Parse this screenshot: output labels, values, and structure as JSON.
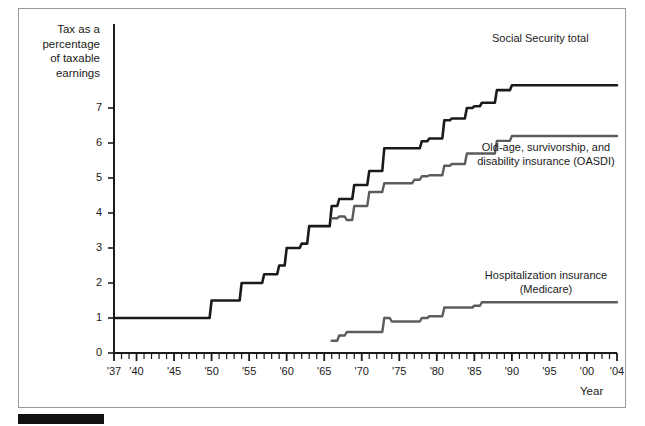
{
  "chart_data": {
    "type": "line",
    "title": "",
    "ylabel": "Tax as a percentage of taxable earnings",
    "xlabel": "Year",
    "xlim": [
      1937,
      2004
    ],
    "ylim": [
      0,
      7.9
    ],
    "yticks": [
      0,
      1,
      2,
      3,
      4,
      5,
      6,
      7
    ],
    "ytick_labels": [
      "0",
      "1",
      "2",
      "3",
      "4",
      "5",
      "6",
      "7"
    ],
    "xticks": [
      1937,
      1940,
      1945,
      1950,
      1955,
      1960,
      1965,
      1970,
      1975,
      1980,
      1985,
      1990,
      1995,
      2000,
      2004
    ],
    "xtick_labels": [
      "'37",
      "'40",
      "'45",
      "'50",
      "'55",
      "'60",
      "'65",
      "'70",
      "'75",
      "'80",
      "'85",
      "'90",
      "'95",
      "'00",
      "'04"
    ],
    "minor_tick_interval": 1,
    "grid": false,
    "legend_position": "inline-annotations",
    "series": [
      {
        "name": "Social Security total",
        "color": "#1a1a1a",
        "width": 2.6,
        "step": true,
        "points": [
          [
            1937,
            1.0
          ],
          [
            1949,
            1.0
          ],
          [
            1950,
            1.5
          ],
          [
            1953,
            1.5
          ],
          [
            1954,
            2.0
          ],
          [
            1956,
            2.0
          ],
          [
            1957,
            2.25
          ],
          [
            1958,
            2.25
          ],
          [
            1959,
            2.5
          ],
          [
            1960,
            3.0
          ],
          [
            1961,
            3.0
          ],
          [
            1962,
            3.125
          ],
          [
            1963,
            3.625
          ],
          [
            1965,
            3.625
          ],
          [
            1966,
            4.2
          ],
          [
            1967,
            4.4
          ],
          [
            1968,
            4.4
          ],
          [
            1969,
            4.8
          ],
          [
            1971,
            5.2
          ],
          [
            1972,
            5.2
          ],
          [
            1973,
            5.85
          ],
          [
            1977,
            5.85
          ],
          [
            1978,
            6.05
          ],
          [
            1979,
            6.13
          ],
          [
            1980,
            6.13
          ],
          [
            1981,
            6.65
          ],
          [
            1982,
            6.7
          ],
          [
            1983,
            6.7
          ],
          [
            1984,
            7.0
          ],
          [
            1985,
            7.05
          ],
          [
            1986,
            7.15
          ],
          [
            1987,
            7.15
          ],
          [
            1988,
            7.51
          ],
          [
            1990,
            7.65
          ],
          [
            2004,
            7.65
          ]
        ]
      },
      {
        "name": "Old-age, survivorship, and disability insurance (OASDI)",
        "color": "#5c5c5c",
        "width": 2.4,
        "step": true,
        "points": [
          [
            1966,
            3.85
          ],
          [
            1967,
            3.9
          ],
          [
            1968,
            3.8
          ],
          [
            1969,
            4.2
          ],
          [
            1971,
            4.6
          ],
          [
            1972,
            4.6
          ],
          [
            1973,
            4.85
          ],
          [
            1977,
            4.95
          ],
          [
            1978,
            5.05
          ],
          [
            1979,
            5.08
          ],
          [
            1980,
            5.08
          ],
          [
            1981,
            5.35
          ],
          [
            1982,
            5.4
          ],
          [
            1983,
            5.4
          ],
          [
            1984,
            5.7
          ],
          [
            1985,
            5.7
          ],
          [
            1986,
            5.7
          ],
          [
            1987,
            5.7
          ],
          [
            1988,
            6.06
          ],
          [
            1990,
            6.2
          ],
          [
            2004,
            6.2
          ]
        ]
      },
      {
        "name": "Hospitalization insurance (Medicare)",
        "color": "#5c5c5c",
        "width": 2.4,
        "step": true,
        "points": [
          [
            1966,
            0.35
          ],
          [
            1967,
            0.5
          ],
          [
            1968,
            0.6
          ],
          [
            1972,
            0.6
          ],
          [
            1973,
            1.0
          ],
          [
            1974,
            0.9
          ],
          [
            1977,
            0.9
          ],
          [
            1978,
            1.0
          ],
          [
            1979,
            1.05
          ],
          [
            1980,
            1.05
          ],
          [
            1981,
            1.3
          ],
          [
            1982,
            1.3
          ],
          [
            1985,
            1.35
          ],
          [
            1986,
            1.45
          ],
          [
            1988,
            1.45
          ],
          [
            1990,
            1.45
          ],
          [
            2004,
            1.45
          ]
        ]
      }
    ]
  },
  "annotations": {
    "ss_total": "Social Security total",
    "oasdi_line1": "Old-age, survivorship, and",
    "oasdi_line2": "disability insurance (OASDI)",
    "hi_line1": "Hospitalization insurance",
    "hi_line2": "(Medicare)"
  },
  "axis": {
    "y_title_line1": "Tax as a",
    "y_title_line2": "percentage",
    "y_title_line3": "of taxable",
    "y_title_line4": "earnings",
    "x_title": "Year"
  }
}
